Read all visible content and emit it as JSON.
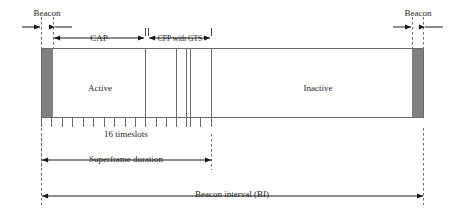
{
  "diagram": {
    "colors": {
      "beacon_fill": "#808080",
      "box_stroke": "#6b6b6b",
      "arrow_stroke": "#1a1a1a",
      "dash_stroke": "#6b6b6b",
      "text": "#262626",
      "background": "#ffffff"
    },
    "labels": {
      "beacon_left": "Beacon",
      "beacon_right": "Beacon",
      "cap": "CAP",
      "cfp": "CFP with GTS",
      "active": "Active",
      "inactive": "Inactive",
      "timeslots": "16 timeslots",
      "superframe_duration": "Superframe duration",
      "beacon_interval": "Beacon interval (BI)"
    },
    "geometry": {
      "box_left": 41,
      "box_right": 424,
      "box_top": 48,
      "box_bottom": 118,
      "beacon_left_x": 41,
      "beacon_left_w": 12,
      "beacon_right_x": 412,
      "beacon_right_w": 12,
      "cap_start": 53,
      "cap_end": 145,
      "cfp_start": 148,
      "cfp_end": 211,
      "superframe_end": 211,
      "timeslot_count": 16,
      "gts_dividers": [
        176,
        186,
        190
      ]
    },
    "measures": [
      {
        "name": "cap",
        "label": "CAP",
        "from": 53,
        "to": 145
      },
      {
        "name": "cfp",
        "label": "CFP with GTS",
        "from": 148,
        "to": 211
      },
      {
        "name": "superframe",
        "label": "Superframe duration",
        "from": 41,
        "to": 211
      },
      {
        "name": "beacon-interval",
        "label": "Beacon interval (BI)",
        "from": 41,
        "to": 424
      }
    ]
  }
}
